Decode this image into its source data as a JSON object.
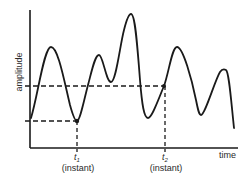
{
  "diagram": {
    "y_axis_label": "amplitude",
    "x_axis_label": "time",
    "markers": [
      {
        "symbol": "t",
        "subscript": "1",
        "caption": "(instant)"
      },
      {
        "symbol": "t",
        "subscript": "2",
        "caption": "(instant)"
      }
    ],
    "colors": {
      "line": "#1a1a1a",
      "text": "#2a2a2a",
      "background": "#ffffff"
    }
  }
}
